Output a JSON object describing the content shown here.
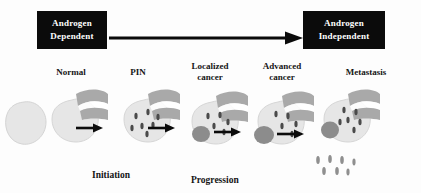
{
  "figure": {
    "background_color": "#fdfdfd"
  },
  "androgen_axis": {
    "start_box": {
      "line1": "Androgen",
      "line2": "Dependent",
      "background_color": "#0b0b0b",
      "text_color": "#ffffff"
    },
    "end_box": {
      "line1": "Androgen",
      "line2": "Independent",
      "background_color": "#0b0b0b",
      "text_color": "#ffffff"
    },
    "arrow": {
      "icon": "right-arrow-icon",
      "direction": "left-to-right",
      "color": "#0b0b0b"
    }
  },
  "stages": [
    {
      "label_line1": "Normal",
      "label_line2": "",
      "tumor": false,
      "dysplastic_foci": 0,
      "metastatic_cells": 0
    },
    {
      "label_line1": "PIN",
      "label_line2": "",
      "tumor": false,
      "dysplastic_foci": 7,
      "metastatic_cells": 0
    },
    {
      "label_line1": "Localized",
      "label_line2": "cancer",
      "tumor": true,
      "dysplastic_foci": 5,
      "metastatic_cells": 0
    },
    {
      "label_line1": "Advanced",
      "label_line2": "cancer",
      "tumor": true,
      "dysplastic_foci": 5,
      "metastatic_cells": 0
    },
    {
      "label_line1": "Metastasis",
      "label_line2": "",
      "tumor": true,
      "dysplastic_foci": 6,
      "metastatic_cells": 7
    }
  ],
  "phases": [
    {
      "name": "Initiation",
      "label": "Initiation"
    },
    {
      "name": "Progression",
      "label": "Progression"
    }
  ],
  "step_arrows": {
    "icon": "right-arrow-icon",
    "count": 5,
    "color": "#0b0b0b"
  },
  "colors": {
    "gland_fill": "#e6e6e6",
    "gland_edge": "#cfcfcf",
    "vesicle_fill": "#a9a9a9",
    "tumor_fill": "#8c8c8c",
    "foci_fill": "#4a4a4a",
    "arrow": "#0b0b0b",
    "box_bg": "#0b0b0b",
    "box_text": "#ffffff",
    "label_text": "#161616"
  }
}
